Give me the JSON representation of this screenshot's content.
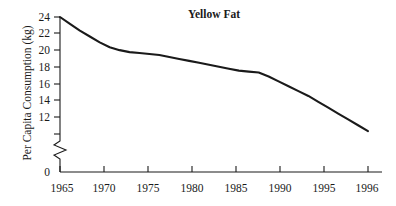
{
  "chart_data": {
    "type": "line",
    "title": "Yellow Fat",
    "xlabel": "",
    "ylabel": "Per Capita Consumption (kg)",
    "x": [
      1965,
      1966,
      1967,
      1968,
      1969,
      1970,
      1971,
      1972,
      1973,
      1974,
      1975,
      1976,
      1977,
      1978,
      1979,
      1980,
      1981,
      1982,
      1983,
      1984,
      1985,
      1986,
      1987,
      1988,
      1989,
      1990,
      1991,
      1992,
      1993,
      1994,
      1995,
      1996
    ],
    "values": [
      24.0,
      23.3,
      22.6,
      22.0,
      21.4,
      20.9,
      20.6,
      20.4,
      20.3,
      20.2,
      20.1,
      19.9,
      19.7,
      19.5,
      19.3,
      19.1,
      18.9,
      18.7,
      18.5,
      18.4,
      18.3,
      17.9,
      17.4,
      16.9,
      16.4,
      15.9,
      15.3,
      14.7,
      14.1,
      13.5,
      12.9,
      12.3
    ],
    "xticks": [
      1965,
      1970,
      1975,
      1980,
      1985,
      1990,
      1995,
      1996
    ],
    "xtick_labels": [
      "1965",
      "1970",
      "1975",
      "1980",
      "1985",
      "1990",
      "1995",
      "1996"
    ],
    "yticks": [
      0,
      12,
      14,
      16,
      18,
      20,
      22,
      24
    ],
    "ytick_labels": [
      "0",
      "12",
      "14",
      "16",
      "18",
      "20",
      "22",
      "24"
    ],
    "xlim": [
      1965,
      1996
    ],
    "ylim": [
      12,
      24
    ],
    "grid": false,
    "legend": false,
    "axis_break": true,
    "axis_break_between": [
      0,
      12
    ],
    "line_color": "#1a1a1a",
    "background_color": "#ffffff"
  }
}
